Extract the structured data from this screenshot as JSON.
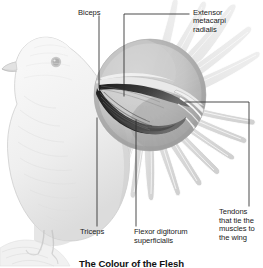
{
  "figure": {
    "caption": "The Colour of the Flesh"
  },
  "callouts": [
    {
      "id": "biceps",
      "label": "Biceps"
    },
    {
      "id": "extensor",
      "label": "Extensor\nmetacarpi\nradialis"
    },
    {
      "id": "triceps",
      "label": "Triceps"
    },
    {
      "id": "flexor",
      "label": "Flexor digitorum\nsuperficialis"
    },
    {
      "id": "tendons",
      "label": "Tendons\nthat tie the\nmuscles to\nthe wing"
    }
  ],
  "colors": {
    "background": "#ffffff",
    "line": "#2b2b2b",
    "text": "#1a1a1a",
    "bird_light": "#f2f2f2",
    "bird_mid": "#d8d8d8",
    "bird_shade": "#bdbdbd",
    "inset_fill": "#bfbfbf",
    "inset_shadow": "#8d8d8d",
    "muscle_dark": "#2e2e2e",
    "muscle_mid": "#5a5a5a",
    "tendon_light": "#e8e8e8"
  },
  "icons": {
    "leader_line": "leader-line",
    "magnifier_circle": "magnified-inset-circle"
  }
}
